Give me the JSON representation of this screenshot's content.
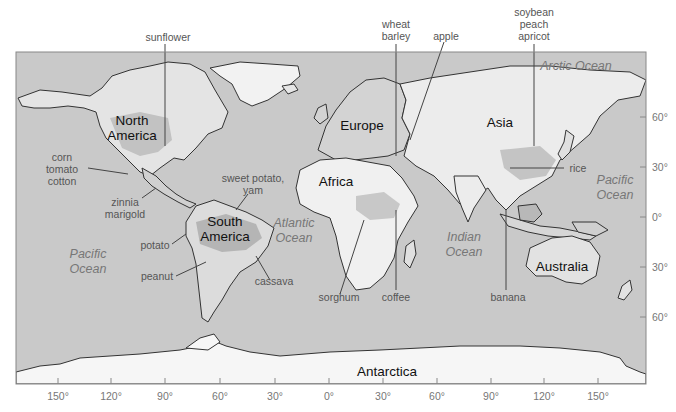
{
  "map": {
    "type": "world-crop-origins",
    "colors": {
      "ocean": "#c9c9c9",
      "land": "#e6e6e6",
      "land_light": "#f4f4f4",
      "land_dark": "#b7b7b7",
      "coast": "#333333",
      "frame": "#888888",
      "label": "#555555",
      "ocean_label": "#777777",
      "continent_label": "#111111"
    },
    "continents": [
      {
        "name": "North America",
        "line1": "North",
        "line2": "America"
      },
      {
        "name": "South America",
        "line1": "South",
        "line2": "America"
      },
      {
        "name": "Europe",
        "line1": "Europe"
      },
      {
        "name": "Africa",
        "line1": "Africa"
      },
      {
        "name": "Asia",
        "line1": "Asia"
      },
      {
        "name": "Australia",
        "line1": "Australia"
      },
      {
        "name": "Antarctica",
        "line1": "Antarctica"
      }
    ],
    "oceans": [
      {
        "line1": "Arctic Ocean"
      },
      {
        "line1": "Pacific",
        "line2": "Ocean"
      },
      {
        "line1": "Atlantic",
        "line2": "Ocean"
      },
      {
        "line1": "Indian",
        "line2": "Ocean"
      },
      {
        "line1": "Pacific",
        "line2": "Ocean"
      }
    ],
    "crop_labels": [
      {
        "lines": [
          "sunflower"
        ]
      },
      {
        "lines": [
          "corn",
          "tomato",
          "cotton"
        ]
      },
      {
        "lines": [
          "zinnia",
          "marigold"
        ]
      },
      {
        "lines": [
          "sweet potato,",
          "yam"
        ]
      },
      {
        "lines": [
          "potato"
        ]
      },
      {
        "lines": [
          "peanut"
        ]
      },
      {
        "lines": [
          "cassava"
        ]
      },
      {
        "lines": [
          "sorghum"
        ]
      },
      {
        "lines": [
          "coffee"
        ]
      },
      {
        "lines": [
          "wheat",
          "barley"
        ]
      },
      {
        "lines": [
          "apple"
        ]
      },
      {
        "lines": [
          "soybean",
          "peach",
          "apricot"
        ]
      },
      {
        "lines": [
          "rice"
        ]
      },
      {
        "lines": [
          "banana"
        ]
      }
    ],
    "longitude_ticks": [
      "150°",
      "120°",
      "90°",
      "60°",
      "30°",
      "0°",
      "30°",
      "60°",
      "90°",
      "120°",
      "150°"
    ],
    "latitude_ticks": [
      "60°",
      "30°",
      "0°",
      "30°",
      "60°"
    ]
  }
}
